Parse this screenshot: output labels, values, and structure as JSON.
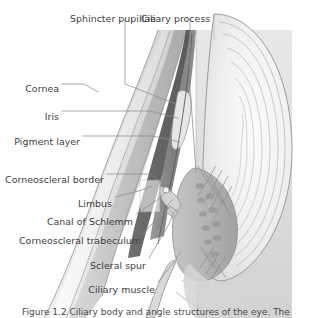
{
  "figure": {
    "caption": "Figure 1.2 Ciliary body and angle structures of the eye. The",
    "background_color": "#ffffff",
    "label_color": "#404040",
    "leader_color": "#8c8c8c"
  },
  "labels": [
    {
      "id": "sphincter-pupillae",
      "text": "Sphincter pupillae",
      "x": 70,
      "y": 14,
      "align": "left"
    },
    {
      "id": "ciliary-process",
      "text": "Ciliary process",
      "x": 141,
      "y": 14,
      "align": "left"
    },
    {
      "id": "cornea",
      "text": "Cornea",
      "x": 59,
      "y": 84,
      "align": "right"
    },
    {
      "id": "iris",
      "text": "Iris",
      "x": 59,
      "y": 112,
      "align": "right"
    },
    {
      "id": "pigment-layer",
      "text": "Pigment layer",
      "x": 80,
      "y": 137,
      "align": "right"
    },
    {
      "id": "corneoscleral-border",
      "text": "Corneoscleral border",
      "x": 104,
      "y": 175,
      "align": "right"
    },
    {
      "id": "limbus",
      "text": "Limbus",
      "x": 112,
      "y": 199,
      "align": "right"
    },
    {
      "id": "canal-of-schlemm",
      "text": "Canal of Schlemm",
      "x": 133,
      "y": 217,
      "align": "right"
    },
    {
      "id": "corneoscleral-trabeculum",
      "text": "Corneoscleral trabeculum",
      "x": 141,
      "y": 236,
      "align": "right"
    },
    {
      "id": "scleral-spur",
      "text": "Scleral spur",
      "x": 146,
      "y": 261,
      "align": "right"
    },
    {
      "id": "ciliary-muscle",
      "text": "Ciliary muscle",
      "x": 155,
      "y": 285,
      "align": "right"
    }
  ],
  "structures": {
    "cornea": "anterior transparent dome",
    "sclera": "outer white coat",
    "iris": "pigmented diaphragm",
    "lens": "concentric lamellar body",
    "ciliary_body": "ciliary muscle and processes",
    "zonules": "suspensory fibres",
    "anterior_chamber_angle": "trabecular meshwork and Schlemm canal"
  }
}
